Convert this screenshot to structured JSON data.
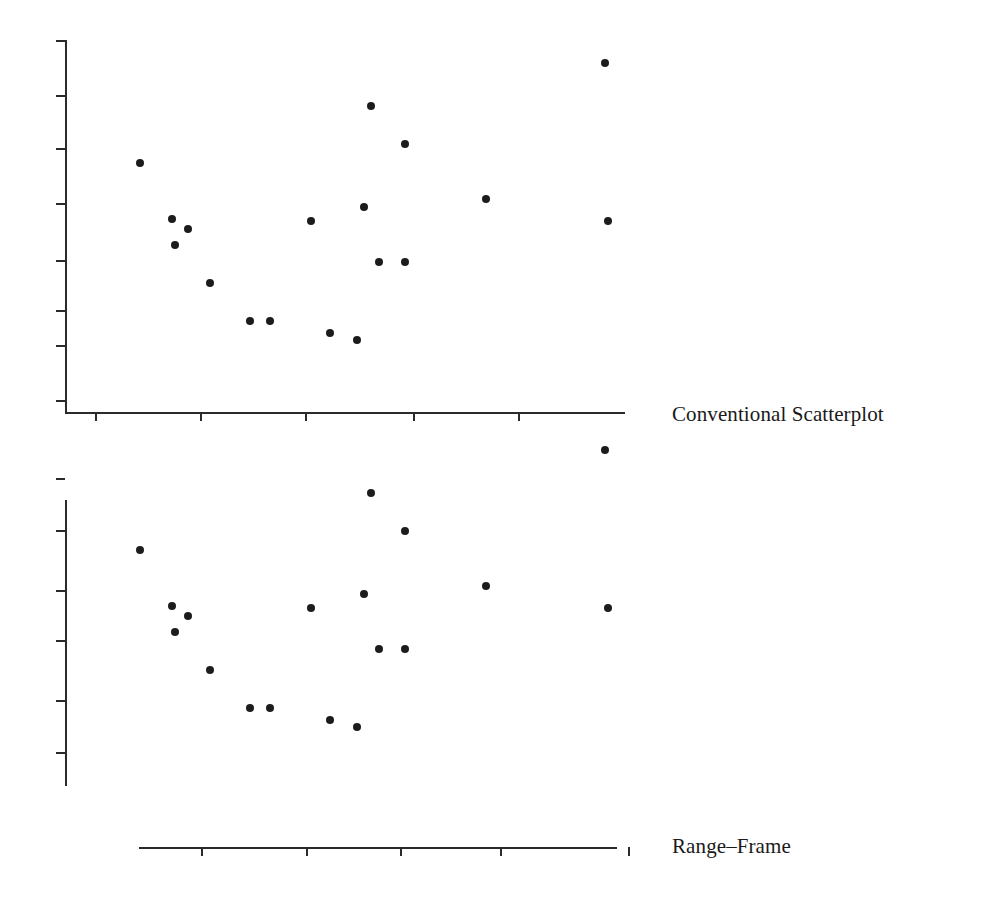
{
  "figure": {
    "background_color": "#ffffff",
    "ink_color": "#2b2b2b",
    "marker_color": "#1c1c1c",
    "width": 985,
    "height": 904
  },
  "panels": [
    {
      "id": "conventional",
      "caption": "Conventional Scatterplot",
      "caption_x": 672,
      "caption_y": 404
    },
    {
      "id": "rangeframe",
      "caption": "Range–Frame",
      "caption_x": 672,
      "caption_y": 836
    }
  ],
  "chart_data": {
    "type": "scatter",
    "title": "",
    "subtitle": "",
    "xlabel": "",
    "ylabel": "",
    "grid": false,
    "legend": false,
    "tick_labels_x": [],
    "tick_labels_y": [],
    "note": "Two renderings of one identical 20-point scatter: a conventional full-box-style axis pair above, and Tufte's range-frame (axis lines trimmed to the data range) below.",
    "xlim": [
      0,
      1
    ],
    "ylim": [
      0,
      1
    ],
    "points_px": [
      {
        "x": 140,
        "y": 163
      },
      {
        "x": 172,
        "y": 219
      },
      {
        "x": 188,
        "y": 229
      },
      {
        "x": 175,
        "y": 245
      },
      {
        "x": 210,
        "y": 283
      },
      {
        "x": 250,
        "y": 321
      },
      {
        "x": 270,
        "y": 321
      },
      {
        "x": 311,
        "y": 221
      },
      {
        "x": 330,
        "y": 333
      },
      {
        "x": 357,
        "y": 340
      },
      {
        "x": 364,
        "y": 207
      },
      {
        "x": 371,
        "y": 106
      },
      {
        "x": 379,
        "y": 262
      },
      {
        "x": 405,
        "y": 144
      },
      {
        "x": 405,
        "y": 262
      },
      {
        "x": 486,
        "y": 199
      },
      {
        "x": 605,
        "y": 63
      },
      {
        "x": 608,
        "y": 221
      }
    ],
    "series": [
      {
        "name": "observations",
        "x": [
          0.134,
          0.191,
          0.22,
          0.196,
          0.259,
          0.33,
          0.366,
          0.439,
          0.473,
          0.521,
          0.534,
          0.546,
          0.561,
          0.607,
          0.607,
          0.752,
          0.964,
          0.97
        ],
        "y": [
          0.669,
          0.518,
          0.491,
          0.448,
          0.346,
          0.244,
          0.244,
          0.513,
          0.212,
          0.194,
          0.551,
          0.822,
          0.403,
          0.719,
          0.403,
          0.573,
          0.938,
          0.513
        ]
      }
    ]
  },
  "axes": {
    "conventional": {
      "y_axis": {
        "x": 65,
        "y_top": 40,
        "y_bottom": 413,
        "style": "full-range"
      },
      "x_axis": {
        "y": 412,
        "x_left": 65,
        "x_right": 625,
        "style": "full-range"
      },
      "y_ticks_px": [
        40,
        95,
        148,
        203,
        260,
        310,
        345,
        400
      ],
      "x_ticks_px": [
        95,
        200,
        305,
        413,
        518
      ],
      "tick_length": 9
    },
    "rangeframe": {
      "y_axis": {
        "x": 65,
        "y_top": 500,
        "y_bottom": 786,
        "style": "range-frame"
      },
      "x_axis": {
        "y": 847,
        "x_left": 139,
        "x_right": 617,
        "style": "range-frame"
      },
      "y_ticks_px": [
        530,
        590,
        640,
        700,
        752
      ],
      "x_ticks_px": [
        201,
        306,
        400,
        500
      ],
      "detached_y_tick_px": 478,
      "detached_x_tick_px": 628,
      "tick_length": 9
    }
  }
}
